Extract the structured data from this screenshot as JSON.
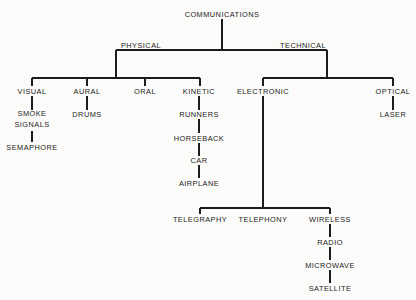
{
  "diagram": {
    "title": "COMMUNICATIONS",
    "type": "tree",
    "colors": {
      "background": "#fbfbf9",
      "text": "#1c1c1c",
      "line": "#1c1c1c"
    },
    "nodes": [
      {
        "id": "communications",
        "label": "COMMUNICATIONS",
        "x": 222,
        "y": 14,
        "level": 0
      },
      {
        "id": "physical",
        "label": "PHYSICAL",
        "x": 141,
        "y": 45,
        "level": 1
      },
      {
        "id": "technical",
        "label": "TECHNICAL",
        "x": 303,
        "y": 45,
        "level": 1
      },
      {
        "id": "visual",
        "label": "VISUAL",
        "x": 32,
        "y": 91,
        "level": 2
      },
      {
        "id": "aural",
        "label": "AURAL",
        "x": 87,
        "y": 91,
        "level": 2
      },
      {
        "id": "oral",
        "label": "ORAL",
        "x": 145,
        "y": 91,
        "level": 2
      },
      {
        "id": "kinetic",
        "label": "KINETIC",
        "x": 199,
        "y": 91,
        "level": 2
      },
      {
        "id": "electronic",
        "label": "ELECTRONIC",
        "x": 263,
        "y": 91,
        "level": 2
      },
      {
        "id": "optical",
        "label": "OPTICAL",
        "x": 393,
        "y": 91,
        "level": 2
      },
      {
        "id": "smoke-signals",
        "label": "SMOKE\nSIGNALS",
        "x": 32,
        "y": 119,
        "level": 3
      },
      {
        "id": "semaphore",
        "label": "SEMAPHORE",
        "x": 32,
        "y": 147,
        "level": 4
      },
      {
        "id": "drums",
        "label": "DRUMS",
        "x": 87,
        "y": 114,
        "level": 3
      },
      {
        "id": "runners",
        "label": "RUNNERS",
        "x": 199,
        "y": 114,
        "level": 3
      },
      {
        "id": "horseback",
        "label": "HORSEBACK",
        "x": 199,
        "y": 138,
        "level": 4
      },
      {
        "id": "car",
        "label": "CAR",
        "x": 199,
        "y": 160,
        "level": 5
      },
      {
        "id": "airplane",
        "label": "AIRPLANE",
        "x": 199,
        "y": 183,
        "level": 6
      },
      {
        "id": "laser",
        "label": "LASER",
        "x": 393,
        "y": 114,
        "level": 3
      },
      {
        "id": "telegraphy",
        "label": "TELEGRAPHY",
        "x": 200,
        "y": 219,
        "level": 3
      },
      {
        "id": "telephony",
        "label": "TELEPHONY",
        "x": 263,
        "y": 219,
        "level": 3
      },
      {
        "id": "wireless",
        "label": "WIRELESS",
        "x": 330,
        "y": 219,
        "level": 3
      },
      {
        "id": "radio",
        "label": "RADIO",
        "x": 330,
        "y": 242,
        "level": 4
      },
      {
        "id": "microwave",
        "label": "MICROWAVE",
        "x": 330,
        "y": 265,
        "level": 5
      },
      {
        "id": "satellite",
        "label": "SATELLITE",
        "x": 330,
        "y": 288,
        "level": 6
      }
    ],
    "edges": [
      {
        "from": "communications",
        "to": "physical"
      },
      {
        "from": "communications",
        "to": "technical"
      },
      {
        "from": "physical",
        "to": "visual"
      },
      {
        "from": "physical",
        "to": "aural"
      },
      {
        "from": "physical",
        "to": "oral"
      },
      {
        "from": "physical",
        "to": "kinetic"
      },
      {
        "from": "technical",
        "to": "electronic"
      },
      {
        "from": "technical",
        "to": "optical"
      },
      {
        "from": "visual",
        "to": "smoke-signals"
      },
      {
        "from": "smoke-signals",
        "to": "semaphore"
      },
      {
        "from": "aural",
        "to": "drums"
      },
      {
        "from": "kinetic",
        "to": "runners"
      },
      {
        "from": "runners",
        "to": "horseback"
      },
      {
        "from": "horseback",
        "to": "car"
      },
      {
        "from": "car",
        "to": "airplane"
      },
      {
        "from": "optical",
        "to": "laser"
      },
      {
        "from": "electronic",
        "to": "telegraphy"
      },
      {
        "from": "electronic",
        "to": "telephony"
      },
      {
        "from": "electronic",
        "to": "wireless"
      },
      {
        "from": "wireless",
        "to": "radio"
      },
      {
        "from": "radio",
        "to": "microwave"
      },
      {
        "from": "microwave",
        "to": "satellite"
      }
    ]
  }
}
